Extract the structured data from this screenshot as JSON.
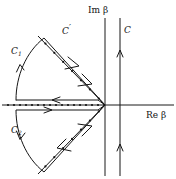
{
  "figure": {
    "background": "#ffffff",
    "ink_color": "#151515",
    "width": 176,
    "height": 179
  },
  "axes": {
    "imaginary": {
      "label": "Im β",
      "label_x": 88,
      "label_y": 12,
      "orientation": "vertical",
      "x": 105,
      "y_top": 18,
      "y_bottom": 176
    },
    "real": {
      "label": "Re β",
      "label_x": 147,
      "label_y": 117,
      "orientation": "horizontal",
      "y": 105,
      "x_left": 2,
      "x_right": 174
    },
    "origin": {
      "x": 105,
      "y": 105
    }
  },
  "labels": {
    "c_prime": {
      "text": "C",
      "prime": "′",
      "x": 64,
      "y": 33
    },
    "c_vertical": {
      "text": "C",
      "x": 124,
      "y": 32
    },
    "c_one": {
      "text": "C",
      "sub": "1",
      "x": 12,
      "y": 52
    },
    "c_two": {
      "text": "C",
      "sub": "2",
      "x": 12,
      "y": 131
    },
    "im_beta": {
      "text": "Im β",
      "x": 88,
      "y": 12
    },
    "re_beta": {
      "text": "Re β",
      "x": 147,
      "y": 117
    }
  },
  "branch_cut": {
    "description": "dotted branch cut along negative real axis",
    "y": 105,
    "x_start": 8,
    "x_end": 104,
    "dot_count": 17,
    "dot_radius": 1.1
  },
  "contour_c": {
    "name": "C",
    "description": "vertical contour just right of the imaginary axis, directed upward",
    "x": 120,
    "y_top": 18,
    "y_bottom": 176,
    "arrow_positions": [
      52,
      146
    ],
    "direction": "up"
  },
  "contour_c_prime": {
    "name": "C′",
    "description": "steepest descent wedge path through the origin, dotted decoration, directed toward origin",
    "upper_start": {
      "x": 38,
      "y": 36
    },
    "apex": {
      "x": 105,
      "y": 105
    },
    "lower_end": {
      "x": 38,
      "y": 174
    },
    "dot_count_per_leg": 7,
    "arrow_positions_upper": [
      0.45
    ],
    "arrow_positions_lower": [
      0.55
    ]
  },
  "contour_c1": {
    "name": "C1",
    "description": "upper keyhole: arc from branch cut up to wedge corner, then straight down-right to origin, then back left along top of cut",
    "arc_from": {
      "x": 14,
      "y": 100
    },
    "arc_to": {
      "x": 44,
      "y": 38
    },
    "corner": {
      "x": 44,
      "y": 38
    },
    "to_origin": {
      "x": 105,
      "y": 105
    },
    "return_y": 100,
    "return_to_x": 16,
    "arrows": [
      "arc-up",
      "down-right",
      "left-return"
    ]
  },
  "contour_c2": {
    "name": "C2",
    "description": "lower keyhole: from below the cut out left, arc down to wedge corner, then up-right to origin",
    "arc_from": {
      "x": 14,
      "y": 110
    },
    "arc_to": {
      "x": 44,
      "y": 172
    },
    "corner": {
      "x": 44,
      "y": 172
    },
    "to_origin": {
      "x": 105,
      "y": 105
    },
    "out_y": 110,
    "out_from_x": 16,
    "arrows": [
      "right-out",
      "arc-down",
      "up-right"
    ]
  }
}
